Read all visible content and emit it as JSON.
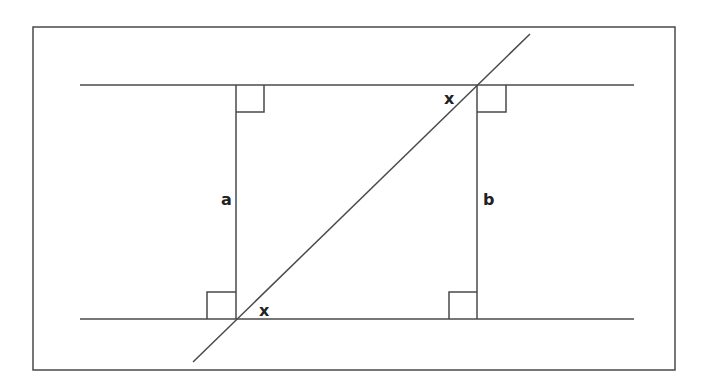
{
  "diagram": {
    "type": "geometry",
    "colors": {
      "stroke": "#4a4a4a",
      "background": "#ffffff",
      "text": "#222222"
    },
    "labels": {
      "segment_left": "a",
      "segment_right": "b",
      "angle_top": "x",
      "angle_bottom": "x"
    },
    "right_angle_markers": 4
  }
}
